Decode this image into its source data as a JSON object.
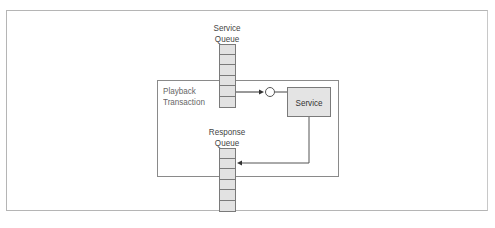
{
  "diagram": {
    "service_queue": {
      "label_line1": "Service",
      "label_line2": "Queue",
      "cells": 6
    },
    "response_queue": {
      "label_line1": "Response",
      "label_line2": "Queue",
      "cells": 6
    },
    "transaction": {
      "label_line1": "Playback",
      "label_line2": "Transaction"
    },
    "service": {
      "label": "Service"
    },
    "colors": {
      "cell_fill": "#e2e2e2",
      "stroke": "#7a7a7a",
      "box_border": "#8a8a8a",
      "frame": "#b5b5b5"
    }
  }
}
